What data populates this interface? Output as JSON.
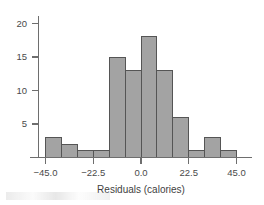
{
  "figure": {
    "background_color": "#ffffff",
    "axis_color": "#6e6e6e",
    "bar_fill_color": "#a3a3a3",
    "bar_edge_color": "#555555"
  },
  "chart_data": {
    "type": "bar",
    "title": "",
    "subtitle": "",
    "xlabel": "Residuals (calories)",
    "ylabel": "",
    "grid": false,
    "legend": null,
    "xlim": [
      -52.5,
      52.5
    ],
    "ylim": [
      0,
      21.5
    ],
    "xticks": [
      -45.0,
      -22.5,
      0.0,
      22.5,
      45.0
    ],
    "xtick_labels": [
      "−45.0",
      "−22.5",
      "0.0",
      "22.5",
      "45.0"
    ],
    "yticks": [
      5,
      10,
      15,
      20
    ],
    "ytick_labels": [
      "5",
      "10",
      "15",
      "20"
    ],
    "bin_width": 7.5,
    "bin_edges": [
      -45.0,
      -37.5,
      -30.0,
      -22.5,
      -15.0,
      -7.5,
      0.0,
      7.5,
      15.0,
      22.5,
      30.0,
      37.5,
      45.0
    ],
    "categories": [
      "−45.0 to −37.5",
      "−37.5 to −30.0",
      "−30.0 to −22.5",
      "−22.5 to −15.0",
      "−15.0 to −7.5",
      "−7.5 to 0.0",
      "0.0 to 7.5",
      "7.5 to 15.0",
      "15.0 to 22.5",
      "22.5 to 30.0",
      "30.0 to 37.5",
      "37.5 to 45.0"
    ],
    "values": [
      3,
      2,
      1,
      1,
      15,
      13,
      18,
      13,
      6,
      1,
      3,
      1
    ]
  }
}
